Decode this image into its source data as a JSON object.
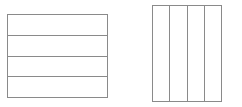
{
  "page": {
    "background_color": "#ffffff",
    "width": 242,
    "height": 107
  },
  "style": {
    "line_color": "#8a8a8a",
    "fill_color": "#ffffff",
    "line_width_px": 1
  },
  "figures": [
    {
      "name": "left-rectangle",
      "orientation": "horizontal",
      "partition_label": "fourths",
      "parts": 4,
      "x": 7,
      "y": 14,
      "width": 101,
      "height": 84,
      "strips": [
        {
          "index": 1,
          "label": ""
        },
        {
          "index": 2,
          "label": ""
        },
        {
          "index": 3,
          "label": ""
        },
        {
          "index": 4,
          "label": ""
        }
      ]
    },
    {
      "name": "right-rectangle",
      "orientation": "vertical",
      "partition_label": "fourths",
      "parts": 4,
      "x": 152,
      "y": 5,
      "width": 70,
      "height": 97,
      "strips": [
        {
          "index": 1,
          "label": ""
        },
        {
          "index": 2,
          "label": ""
        },
        {
          "index": 3,
          "label": ""
        },
        {
          "index": 4,
          "label": ""
        }
      ]
    }
  ]
}
